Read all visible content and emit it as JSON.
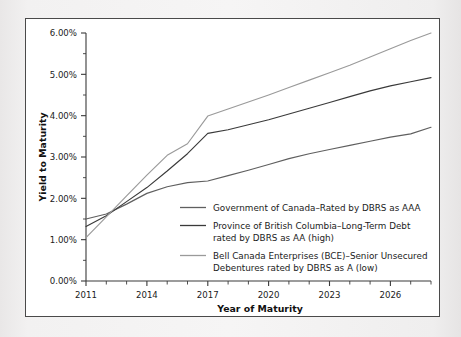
{
  "chart_data": {
    "type": "line",
    "title": "",
    "xlabel": "Year of Maturity",
    "ylabel": "Yield to Maturity",
    "xlim": [
      2011,
      2028
    ],
    "ylim": [
      0,
      6
    ],
    "grid": false,
    "legend_position": "inside-center",
    "y_ticks": [
      0,
      1,
      2,
      3,
      4,
      5,
      6
    ],
    "y_tick_labels": [
      "0.00%",
      "1.00%",
      "2.00%",
      "3.00%",
      "4.00%",
      "5.00%",
      "6.00%"
    ],
    "y_minor_ticks": [
      0.5,
      1.5,
      2.5,
      3.5,
      4.5,
      5.5
    ],
    "x_ticks": [
      2011,
      2012,
      2013,
      2014,
      2015,
      2016,
      2017,
      2018,
      2019,
      2020,
      2021,
      2022,
      2023,
      2024,
      2025,
      2026,
      2027,
      2028
    ],
    "x_tick_labels": [
      "2011",
      "",
      "",
      "2014",
      "",
      "",
      "2017",
      "",
      "",
      "2020",
      "",
      "",
      "2023",
      "",
      "",
      "2026",
      "",
      ""
    ],
    "x_labeled_ticks": [
      2011,
      2014,
      2017,
      2020,
      2023,
      2026
    ],
    "x": [
      2011,
      2012,
      2013,
      2014,
      2015,
      2016,
      2017,
      2018,
      2019,
      2020,
      2021,
      2022,
      2023,
      2024,
      2025,
      2026,
      2027,
      2028
    ],
    "series": [
      {
        "name": "Government of Canada—Rated by DBRS as AAA",
        "color": "#5f5f5f",
        "values": [
          1.5,
          1.62,
          1.86,
          2.12,
          2.28,
          2.38,
          2.42,
          2.55,
          2.68,
          2.82,
          2.96,
          3.08,
          3.18,
          3.28,
          3.38,
          3.48,
          3.56,
          3.72
        ]
      },
      {
        "name": "Province of British Columbia—Long-Term Debt rated by DBRS as AA (high)",
        "color": "#3a3a3a",
        "values": [
          1.32,
          1.58,
          1.92,
          2.26,
          2.66,
          3.08,
          3.57,
          3.66,
          3.78,
          3.9,
          4.04,
          4.18,
          4.32,
          4.46,
          4.6,
          4.72,
          4.82,
          4.92
        ]
      },
      {
        "name": "Bell Canada Enterprises (BCE)—Senior Unsecured Debentures rated by DBRS as A (low)",
        "color": "#9a9a9a",
        "values": [
          1.05,
          1.55,
          2.06,
          2.56,
          3.04,
          3.32,
          3.99,
          4.16,
          4.33,
          4.5,
          4.68,
          4.86,
          5.04,
          5.22,
          5.42,
          5.62,
          5.82,
          6.0
        ]
      }
    ]
  },
  "legend": {
    "entries": [
      {
        "line1": "Government of Canada–Rated by DBRS as AAA",
        "line2": "",
        "color": "#5f5f5f"
      },
      {
        "line1": "Province of British Columbia–Long-Term Debt",
        "line2": "rated by DBRS as AA (high)",
        "color": "#3a3a3a"
      },
      {
        "line1": "Bell Canada Enterprises (BCE)–Senior Unsecured",
        "line2": "Debentures rated by DBRS as A (low)",
        "color": "#9a9a9a"
      }
    ]
  },
  "axes": {
    "y_title": "Yield to Maturity",
    "x_title": "Year of Maturity",
    "y_labels": [
      "6.00%",
      "5.00%",
      "4.00%",
      "3.00%",
      "2.00%",
      "1.00%",
      "0.00%"
    ],
    "x_labels": [
      "2011",
      "2014",
      "2017",
      "2020",
      "2023",
      "2026"
    ]
  }
}
